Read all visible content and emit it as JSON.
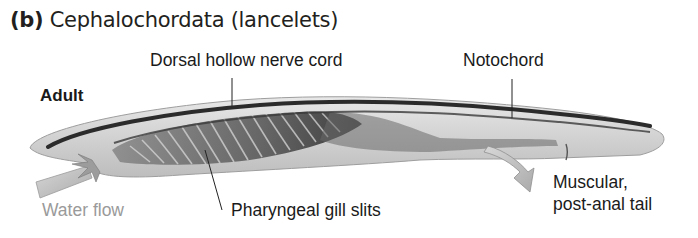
{
  "figure": {
    "panel_letter": "(b)",
    "title": "Cephalochordata (lancelets)",
    "stage_label": "Adult"
  },
  "labels": {
    "dorsal_nerve_cord": "Dorsal hollow nerve cord",
    "notochord": "Notochord",
    "pharyngeal_gill_slits": "Pharyngeal gill slits",
    "water_flow": "Water flow",
    "tail_line1": "Muscular,",
    "tail_line2": "post-anal tail"
  },
  "colors": {
    "text": "#1a1a1a",
    "water_flow_text": "#9a9a9a",
    "body_fill": "#d6d6d6",
    "dark_structures": "#2b2b2b",
    "arrow_fill": "#c4c4c4"
  }
}
